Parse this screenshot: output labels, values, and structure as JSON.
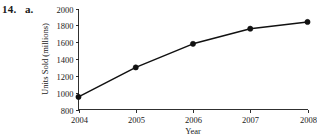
{
  "problem": {
    "number": "14.",
    "part": "a."
  },
  "chart_data": {
    "type": "line",
    "title": "",
    "xlabel": "Year",
    "ylabel": "Units Sold (millions)",
    "categories": [
      "2004",
      "2005",
      "2006",
      "2007",
      "2008"
    ],
    "x": [
      2004,
      2005,
      2006,
      2007,
      2008
    ],
    "values": [
      950,
      1300,
      1580,
      1760,
      1840
    ],
    "series": [
      {
        "name": "Units Sold",
        "values": [
          950,
          1300,
          1580,
          1760,
          1840
        ]
      }
    ],
    "xlim": [
      2004,
      2008
    ],
    "ylim": [
      800,
      2000
    ],
    "yticks": [
      800,
      1000,
      1200,
      1400,
      1600,
      1800,
      2000
    ],
    "ytick_labels": [
      "800",
      "1000",
      "1200",
      "1400",
      "1600",
      "1800",
      "2000"
    ],
    "xticks": [
      2004,
      2005,
      2006,
      2007,
      2008
    ],
    "xtick_labels": [
      "2004",
      "2005",
      "2006",
      "2007",
      "2008"
    ],
    "grid": false,
    "legend": false,
    "legend_position": "none",
    "marker": "circle",
    "line_color": "#111111",
    "marker_color": "#111111",
    "axis_color": "#1a1a1a",
    "background_color": "#ffffff"
  }
}
